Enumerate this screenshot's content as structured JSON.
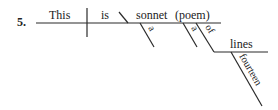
{
  "diagram": {
    "item_number": "5.",
    "type": "sentence-diagram",
    "sentence": "This is a sonnet (poem) of fourteen lines",
    "words": {
      "subject": "This",
      "verb": "is",
      "predicate_nominative": "sonnet",
      "appositive": "(poem)",
      "modifier_1": "a",
      "modifier_2": "a",
      "preposition": "of",
      "object_of_preposition": "lines",
      "object_modifier": "fourteen"
    },
    "ink_color": "#2a2a2a"
  }
}
